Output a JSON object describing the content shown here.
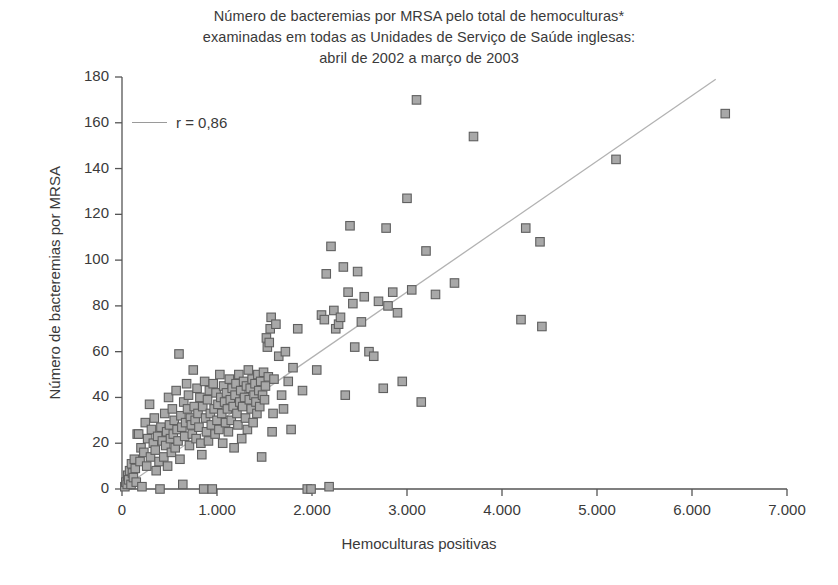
{
  "title": {
    "lines": [
      "Número de bacteremias por MRSA pelo total de hemoculturas*",
      "examinadas em todas as Unidades de Serviço de Saúde inglesas:",
      "abril de 2002 a março de 2003"
    ]
  },
  "legend": {
    "label": "r = 0,86",
    "line_color": "#9a9a9a"
  },
  "colors": {
    "background": "#ffffff",
    "text": "#3a3a3a",
    "axis": "#555555",
    "marker_fill": "#a8a8a8",
    "marker_edge": "#5f5f5f",
    "trend_line": "#b2b2b2"
  },
  "chart_data": {
    "type": "scatter",
    "title": "Número de bacteremias por MRSA pelo total de hemoculturas* examinadas em todas as Unidades de Serviço de Saúde inglesas: abril de 2002 a março de 2003",
    "xlabel": "Hemoculturas positivas",
    "ylabel": "Número de bacteremias por MRSA",
    "xlim": [
      0,
      7000
    ],
    "ylim": [
      0,
      180
    ],
    "xticks": [
      0,
      1000,
      2000,
      3000,
      4000,
      5000,
      6000,
      7000
    ],
    "xtick_labels": [
      "0",
      "1.000",
      "2.000",
      "3.000",
      "4.000",
      "5.000",
      "6.000",
      "7.000"
    ],
    "yticks": [
      0,
      20,
      40,
      60,
      80,
      100,
      120,
      140,
      160,
      180
    ],
    "ytick_labels": [
      "0",
      "20",
      "40",
      "60",
      "80",
      "100",
      "120",
      "140",
      "160",
      "180"
    ],
    "grid": false,
    "legend_position": "upper-left",
    "annotations": [
      {
        "text": "r = 0,86",
        "kind": "legend-entry"
      }
    ],
    "correlation": 0.86,
    "marker": "square",
    "trend_line": {
      "type": "linear-fit",
      "x_start": 60,
      "y_start": 2,
      "x_end": 6250,
      "y_end": 179
    },
    "series": [
      {
        "name": "Unidades de Serviço de Saúde",
        "points": [
          [
            30,
            1
          ],
          [
            40,
            3
          ],
          [
            55,
            2
          ],
          [
            60,
            6
          ],
          [
            70,
            4
          ],
          [
            80,
            8
          ],
          [
            95,
            2
          ],
          [
            100,
            11
          ],
          [
            110,
            7
          ],
          [
            120,
            5
          ],
          [
            130,
            13
          ],
          [
            140,
            9
          ],
          [
            150,
            3
          ],
          [
            160,
            24
          ],
          [
            175,
            24
          ],
          [
            190,
            12
          ],
          [
            200,
            18
          ],
          [
            210,
            1
          ],
          [
            230,
            16
          ],
          [
            245,
            29
          ],
          [
            260,
            10
          ],
          [
            270,
            22
          ],
          [
            290,
            37
          ],
          [
            300,
            14
          ],
          [
            310,
            26
          ],
          [
            330,
            20
          ],
          [
            340,
            31
          ],
          [
            350,
            17
          ],
          [
            360,
            8
          ],
          [
            375,
            23
          ],
          [
            390,
            12
          ],
          [
            400,
            0
          ],
          [
            410,
            27
          ],
          [
            425,
            21
          ],
          [
            440,
            14
          ],
          [
            450,
            33
          ],
          [
            460,
            19
          ],
          [
            470,
            25
          ],
          [
            480,
            10
          ],
          [
            490,
            40
          ],
          [
            500,
            28
          ],
          [
            510,
            22
          ],
          [
            520,
            16
          ],
          [
            530,
            35
          ],
          [
            540,
            24
          ],
          [
            550,
            30
          ],
          [
            560,
            18
          ],
          [
            570,
            43
          ],
          [
            580,
            26
          ],
          [
            590,
            21
          ],
          [
            600,
            59
          ],
          [
            610,
            13
          ],
          [
            620,
            32
          ],
          [
            630,
            27
          ],
          [
            640,
            2
          ],
          [
            650,
            38
          ],
          [
            660,
            23
          ],
          [
            670,
            29
          ],
          [
            680,
            46
          ],
          [
            690,
            35
          ],
          [
            700,
            41
          ],
          [
            710,
            19
          ],
          [
            720,
            31
          ],
          [
            730,
            28
          ],
          [
            740,
            24
          ],
          [
            750,
            52
          ],
          [
            760,
            36
          ],
          [
            770,
            30
          ],
          [
            780,
            22
          ],
          [
            790,
            44
          ],
          [
            800,
            33
          ],
          [
            810,
            27
          ],
          [
            820,
            40
          ],
          [
            830,
            20
          ],
          [
            840,
            15
          ],
          [
            850,
            36
          ],
          [
            860,
            0
          ],
          [
            870,
            47
          ],
          [
            880,
            31
          ],
          [
            890,
            25
          ],
          [
            900,
            39
          ],
          [
            910,
            21
          ],
          [
            920,
            43
          ],
          [
            930,
            33
          ],
          [
            940,
            28
          ],
          [
            950,
            0
          ],
          [
            960,
            46
          ],
          [
            970,
            35
          ],
          [
            980,
            24
          ],
          [
            990,
            42
          ],
          [
            1000,
            30
          ],
          [
            1010,
            37
          ],
          [
            1020,
            26
          ],
          [
            1030,
            50
          ],
          [
            1040,
            40
          ],
          [
            1050,
            33
          ],
          [
            1060,
            20
          ],
          [
            1070,
            45
          ],
          [
            1080,
            38
          ],
          [
            1090,
            29
          ],
          [
            1100,
            42
          ],
          [
            1110,
            35
          ],
          [
            1120,
            25
          ],
          [
            1130,
            48
          ],
          [
            1140,
            39
          ],
          [
            1150,
            30
          ],
          [
            1160,
            44
          ],
          [
            1170,
            36
          ],
          [
            1180,
            18
          ],
          [
            1190,
            41
          ],
          [
            1200,
            46
          ],
          [
            1210,
            33
          ],
          [
            1220,
            28
          ],
          [
            1230,
            50
          ],
          [
            1240,
            38
          ],
          [
            1250,
            43
          ],
          [
            1260,
            22
          ],
          [
            1270,
            36
          ],
          [
            1280,
            47
          ],
          [
            1290,
            40
          ],
          [
            1300,
            31
          ],
          [
            1310,
            45
          ],
          [
            1320,
            26
          ],
          [
            1330,
            52
          ],
          [
            1340,
            39
          ],
          [
            1350,
            44
          ],
          [
            1360,
            35
          ],
          [
            1370,
            48
          ],
          [
            1380,
            29
          ],
          [
            1390,
            41
          ],
          [
            1400,
            46
          ],
          [
            1410,
            38
          ],
          [
            1420,
            33
          ],
          [
            1430,
            50
          ],
          [
            1440,
            43
          ],
          [
            1450,
            36
          ],
          [
            1460,
            47
          ],
          [
            1470,
            14
          ],
          [
            1480,
            41
          ],
          [
            1490,
            51
          ],
          [
            1500,
            39
          ],
          [
            1510,
            45
          ],
          [
            1520,
            66
          ],
          [
            1530,
            62
          ],
          [
            1540,
            49
          ],
          [
            1550,
            64
          ],
          [
            1560,
            70
          ],
          [
            1570,
            75
          ],
          [
            1580,
            25
          ],
          [
            1590,
            33
          ],
          [
            1600,
            48
          ],
          [
            1620,
            72
          ],
          [
            1650,
            58
          ],
          [
            1680,
            41
          ],
          [
            1700,
            35
          ],
          [
            1720,
            60
          ],
          [
            1750,
            47
          ],
          [
            1780,
            26
          ],
          [
            1800,
            53
          ],
          [
            1850,
            70
          ],
          [
            1900,
            43
          ],
          [
            1950,
            0
          ],
          [
            1990,
            0
          ],
          [
            2050,
            52
          ],
          [
            2100,
            76
          ],
          [
            2130,
            74
          ],
          [
            2150,
            94
          ],
          [
            2180,
            1
          ],
          [
            2200,
            106
          ],
          [
            2230,
            78
          ],
          [
            2250,
            70
          ],
          [
            2280,
            72
          ],
          [
            2300,
            75
          ],
          [
            2330,
            97
          ],
          [
            2350,
            41
          ],
          [
            2380,
            86
          ],
          [
            2400,
            115
          ],
          [
            2430,
            81
          ],
          [
            2450,
            62
          ],
          [
            2480,
            95
          ],
          [
            2520,
            73
          ],
          [
            2550,
            84
          ],
          [
            2600,
            60
          ],
          [
            2650,
            58
          ],
          [
            2700,
            82
          ],
          [
            2750,
            44
          ],
          [
            2780,
            114
          ],
          [
            2800,
            80
          ],
          [
            2850,
            86
          ],
          [
            2900,
            77
          ],
          [
            2950,
            47
          ],
          [
            3000,
            127
          ],
          [
            3050,
            87
          ],
          [
            3100,
            170
          ],
          [
            3150,
            38
          ],
          [
            3200,
            104
          ],
          [
            3300,
            85
          ],
          [
            3500,
            90
          ],
          [
            3700,
            154
          ],
          [
            4200,
            74
          ],
          [
            4250,
            114
          ],
          [
            4400,
            108
          ],
          [
            4420,
            71
          ],
          [
            5200,
            144
          ],
          [
            6350,
            164
          ]
        ]
      }
    ]
  },
  "axes_geometry": {
    "left": 122,
    "right": 787,
    "top": 77,
    "bottom": 489
  }
}
